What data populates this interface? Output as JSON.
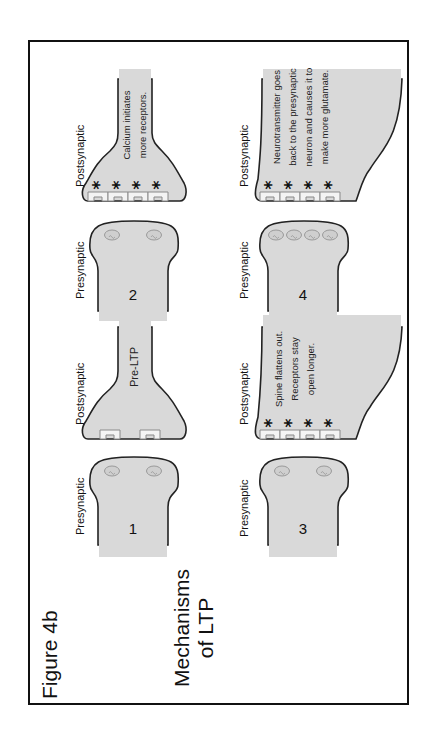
{
  "figure": {
    "title": "Figure 4b",
    "subtitle_line1": "Mechanisms",
    "subtitle_line2": "of LTP",
    "orientation": "rotated 90° counter-clockwise",
    "fill_color": "#d9d9d9",
    "outline_color": "#222222"
  },
  "panels": [
    {
      "step": "1",
      "presynaptic_label": "Presynaptic",
      "postsynaptic_label": "Postsynaptic",
      "vesicles": 2,
      "receptors": 2,
      "stars": 0,
      "caption_lines": [
        "Pre-LTP"
      ]
    },
    {
      "step": "2",
      "presynaptic_label": "Presynaptic",
      "postsynaptic_label": "Postsynaptic",
      "vesicles": 2,
      "receptors": 4,
      "stars": 4,
      "caption_lines": [
        "Calcium initiates",
        "more receptors."
      ]
    },
    {
      "step": "3",
      "presynaptic_label": "Presynaptic",
      "postsynaptic_label": "Postsynaptic",
      "vesicles": 2,
      "receptors": 4,
      "stars": 4,
      "caption_lines": [
        "Spine flattens out.",
        "Receptors stay",
        "open longer."
      ]
    },
    {
      "step": "4",
      "presynaptic_label": "Presynaptic",
      "postsynaptic_label": "Postsynaptic",
      "vesicles": 4,
      "receptors": 4,
      "stars": 4,
      "caption_lines": [
        "Neurotransmitter goes",
        "back to the presynaptic",
        "neuron and causes it to",
        "make more glutamate."
      ]
    }
  ]
}
